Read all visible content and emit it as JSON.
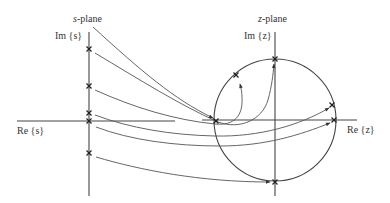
{
  "diagram": {
    "s_plane": {
      "title": "s-plane",
      "title_var": "s",
      "title_suffix": "-plane",
      "im_label": "Im {s}",
      "re_label": "Re {s}",
      "poles": [
        {
          "x": 89,
          "y": 49
        },
        {
          "x": 89,
          "y": 86
        },
        {
          "x": 89,
          "y": 113
        },
        {
          "x": 89,
          "y": 121
        },
        {
          "x": 89,
          "y": 153
        }
      ]
    },
    "z_plane": {
      "title": "z-plane",
      "title_var": "z",
      "title_suffix": "-plane",
      "im_label": "Im {z}",
      "re_label": "Re {z}",
      "unit_circle": {
        "cx": 275,
        "cy": 120,
        "r": 61
      },
      "poles": [
        {
          "x": 275,
          "y": 59
        },
        {
          "x": 236,
          "y": 75
        },
        {
          "x": 216,
          "y": 121
        },
        {
          "x": 332,
          "y": 105
        },
        {
          "x": 334,
          "y": 120
        },
        {
          "x": 275,
          "y": 182
        }
      ]
    },
    "mappings": [
      {
        "from": "s-plane title",
        "to": "z pole on negative real axis"
      },
      {
        "from": "s pole (89,49)",
        "to": "z pole top of unit circle"
      },
      {
        "from": "s pole (89,86)",
        "to": "z pole upper-left of unit circle"
      },
      {
        "from": "s pole (89,113)",
        "to": "z pole upper-right of unit circle"
      },
      {
        "from": "s pole (89,121)",
        "to": "z pole at z=1"
      },
      {
        "from": "s pole (89,153)",
        "to": "z pole bottom of unit circle"
      }
    ],
    "colors": {
      "ink": "#333333",
      "background": "#ffffff"
    }
  }
}
